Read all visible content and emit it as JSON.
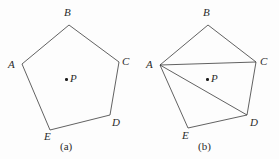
{
  "figures": [
    {
      "id": "figure-a",
      "caption": "(a)",
      "caption_pos": {
        "x": 60,
        "y": 141
      },
      "interior_point": {
        "label": "P",
        "dot": {
          "x": 65,
          "y": 78
        },
        "label_pos": {
          "x": 70,
          "y": 73
        }
      },
      "vertices": [
        {
          "name": "A",
          "x": 22,
          "y": 64,
          "label_pos": {
            "x": 8,
            "y": 59
          }
        },
        {
          "name": "B",
          "x": 69,
          "y": 25,
          "label_pos": {
            "x": 64,
            "y": 7
          }
        },
        {
          "name": "C",
          "x": 119,
          "y": 62,
          "label_pos": {
            "x": 122,
            "y": 56
          }
        },
        {
          "name": "D",
          "x": 110,
          "y": 115,
          "label_pos": {
            "x": 112,
            "y": 117
          }
        },
        {
          "name": "E",
          "x": 50,
          "y": 130,
          "label_pos": {
            "x": 44,
            "y": 131
          }
        }
      ],
      "outline": [
        "A",
        "B",
        "C",
        "D",
        "E"
      ],
      "diagonals": []
    },
    {
      "id": "figure-b",
      "caption": "(b)",
      "caption_pos": {
        "x": 198,
        "y": 141
      },
      "interior_point": {
        "label": "P",
        "dot": {
          "x": 206,
          "y": 78
        },
        "label_pos": {
          "x": 211,
          "y": 73
        }
      },
      "vertices": [
        {
          "name": "A",
          "x": 160,
          "y": 65,
          "label_pos": {
            "x": 146,
            "y": 59
          }
        },
        {
          "name": "B",
          "x": 208,
          "y": 25,
          "label_pos": {
            "x": 203,
            "y": 7
          }
        },
        {
          "name": "C",
          "x": 256,
          "y": 62,
          "label_pos": {
            "x": 260,
            "y": 56
          }
        },
        {
          "name": "D",
          "x": 247,
          "y": 115,
          "label_pos": {
            "x": 250,
            "y": 117
          }
        },
        {
          "name": "E",
          "x": 188,
          "y": 128,
          "label_pos": {
            "x": 182,
            "y": 130
          }
        }
      ],
      "outline": [
        "A",
        "B",
        "C",
        "D",
        "E"
      ],
      "diagonals": [
        {
          "from": "A",
          "to": "C"
        },
        {
          "from": "A",
          "to": "D"
        }
      ]
    }
  ],
  "style": {
    "stroke_color": "#3a3a3a",
    "stroke_width": 0.8,
    "background": "#fdfdfd",
    "text_color": "#2b2b2b"
  }
}
